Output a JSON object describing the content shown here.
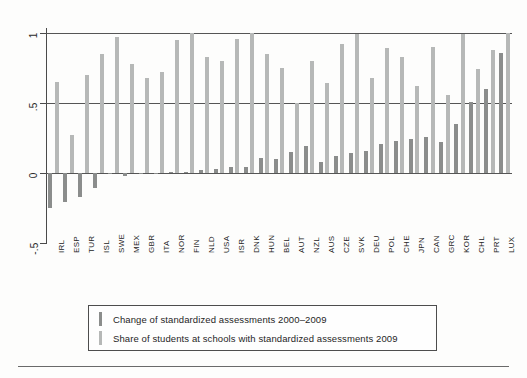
{
  "chart_data": {
    "type": "bar",
    "title": "",
    "subtitle": "",
    "xlabel": "",
    "ylabel": "",
    "ylim": [
      -0.5,
      1.0
    ],
    "yticks": [
      1,
      0.5,
      0,
      -0.5
    ],
    "ytick_labels": [
      "1",
      ".5",
      "0",
      "-.5"
    ],
    "grid": true,
    "gridlines_at": [
      1,
      0.5,
      0
    ],
    "legend_position": "bottom",
    "categories": [
      "IRL",
      "ESP",
      "TUR",
      "ISL",
      "SWE",
      "MEX",
      "GBR",
      "ITA",
      "NOR",
      "FIN",
      "NLD",
      "USA",
      "ISR",
      "DNK",
      "HUN",
      "BEL",
      "AUT",
      "NZL",
      "AUS",
      "CZE",
      "SVK",
      "DEU",
      "POL",
      "CHE",
      "JPN",
      "CAN",
      "GRC",
      "KOR",
      "CHL",
      "PRT",
      "LUX"
    ],
    "series": [
      {
        "name": "Change of standardized assessments 2000-2009",
        "key": "dark",
        "color": "#8b8d8c",
        "values": [
          -0.25,
          -0.21,
          -0.17,
          -0.11,
          -0.01,
          -0.02,
          -0.01,
          0.0,
          0.01,
          0.01,
          0.02,
          0.03,
          0.04,
          0.04,
          0.11,
          0.1,
          0.15,
          0.19,
          0.08,
          0.12,
          0.14,
          0.16,
          0.21,
          0.23,
          0.24,
          0.26,
          0.22,
          0.35,
          0.51,
          0.6,
          0.86
        ]
      },
      {
        "name": "Share of students at schools with standardized assessments 2009",
        "key": "light",
        "color": "#b6b8b7",
        "values": [
          0.65,
          0.27,
          0.7,
          0.85,
          0.97,
          0.78,
          0.68,
          0.72,
          0.95,
          1.0,
          0.83,
          0.8,
          0.96,
          1.0,
          0.85,
          0.75,
          0.5,
          0.8,
          0.64,
          0.92,
          0.99,
          0.68,
          0.89,
          0.83,
          0.62,
          0.9,
          0.56,
          0.99,
          0.74,
          0.88,
          1.0
        ]
      }
    ]
  },
  "legend": {
    "items": [
      {
        "label": "Change of standardized assessments 2000–2009",
        "key": "dark"
      },
      {
        "label": "Share of students at schools with standardized assessments 2009",
        "key": "light"
      }
    ]
  }
}
